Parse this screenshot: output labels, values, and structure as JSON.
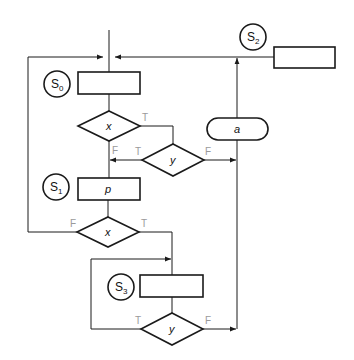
{
  "diagram": {
    "type": "flowchart",
    "states": [
      {
        "id": "S0",
        "base": "S",
        "sub": "0"
      },
      {
        "id": "S1",
        "base": "S",
        "sub": "1"
      },
      {
        "id": "S2",
        "base": "S",
        "sub": "2"
      },
      {
        "id": "S3",
        "base": "S",
        "sub": "3"
      }
    ],
    "boxes": {
      "s0_box": "",
      "s1_box": "p",
      "s2_box": "",
      "s3_box": ""
    },
    "decisions": {
      "d1": "x",
      "d2": "y",
      "d3": "x",
      "d4": "y"
    },
    "conditional_output": "a",
    "branch_labels": {
      "d1_true": "T",
      "d1_false": "F",
      "d2_true": "T",
      "d2_false": "F",
      "d3_true": "T",
      "d3_false": "F",
      "d4_true": "T",
      "d4_false": "F"
    }
  }
}
